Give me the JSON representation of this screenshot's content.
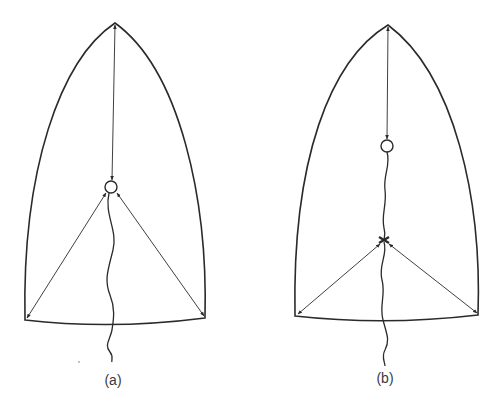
{
  "figure": {
    "panels": [
      {
        "id": "a",
        "label": "(a)",
        "description": "Sail outline with a ring at the center connected by arrows to the head, tack, and clew; a wavy line runs from the ring down past the foot."
      },
      {
        "id": "b",
        "label": "(b)",
        "description": "Sail outline with a ring high on the centerline connected to the head; a wavy line runs from the ring to a lower junction point which connects by arrows to the tack and clew, and continues down past the foot."
      }
    ],
    "colors": {
      "stroke": "#2a2a2a",
      "background": "#ffffff"
    }
  }
}
